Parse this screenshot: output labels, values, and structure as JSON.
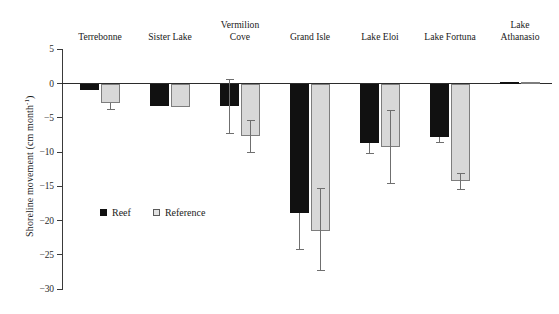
{
  "chart_data": {
    "type": "bar",
    "title": "",
    "subtitle": "",
    "xlabel": "",
    "ylabel": "Shoreline movement (cm month",
    "ylabel_exponent": "-1",
    "ylabel_suffix": ")",
    "ylim": [
      -30,
      5
    ],
    "yticks": [
      5,
      0,
      -5,
      -10,
      -15,
      -20,
      -25,
      -30
    ],
    "ytick_labels": [
      "5",
      "0",
      "−5",
      "−10",
      "−15",
      "−20",
      "−25",
      "−30"
    ],
    "grid": false,
    "legend_position": "inside-lower-left",
    "categories": [
      "Terrebonne",
      "Sister Lake",
      "Vermilion\nCove",
      "Grand Isle",
      "Lake Eloi",
      "Lake Fortuna",
      "Lake\nAthanasio"
    ],
    "series": [
      {
        "name": "Reef",
        "color": "#111111",
        "values": [
          -1.0,
          -3.3,
          -3.3,
          -18.9,
          -8.7,
          -7.8,
          0.2
        ],
        "err_low": [
          null,
          null,
          -7.2,
          -24.1,
          -10.2,
          -8.6,
          null
        ],
        "err_high": [
          null,
          null,
          0.7,
          null,
          null,
          null,
          null
        ]
      },
      {
        "name": "Reference",
        "color": "#d8d8d8",
        "values": [
          -2.9,
          -3.4,
          -7.6,
          -21.6,
          -9.3,
          -14.2,
          0.15
        ],
        "err_low": [
          -3.7,
          null,
          -10.0,
          -27.2,
          -14.5,
          -15.4,
          null
        ],
        "err_high": [
          null,
          null,
          -5.4,
          -15.3,
          -3.9,
          -13.1,
          null
        ]
      }
    ],
    "annotations": []
  },
  "legend": {
    "entries": [
      {
        "label": "Reef",
        "swatch": "filled-black-square"
      },
      {
        "label": "Reference",
        "swatch": "outlined-gray-square"
      }
    ]
  },
  "colors": {
    "reef": "#111111",
    "reference_fill": "#d8d8d8",
    "reference_stroke": "#7d7d7d",
    "axis": "#2b2b2b",
    "error_bar": "#6f6f6f",
    "background": "#ffffff"
  }
}
